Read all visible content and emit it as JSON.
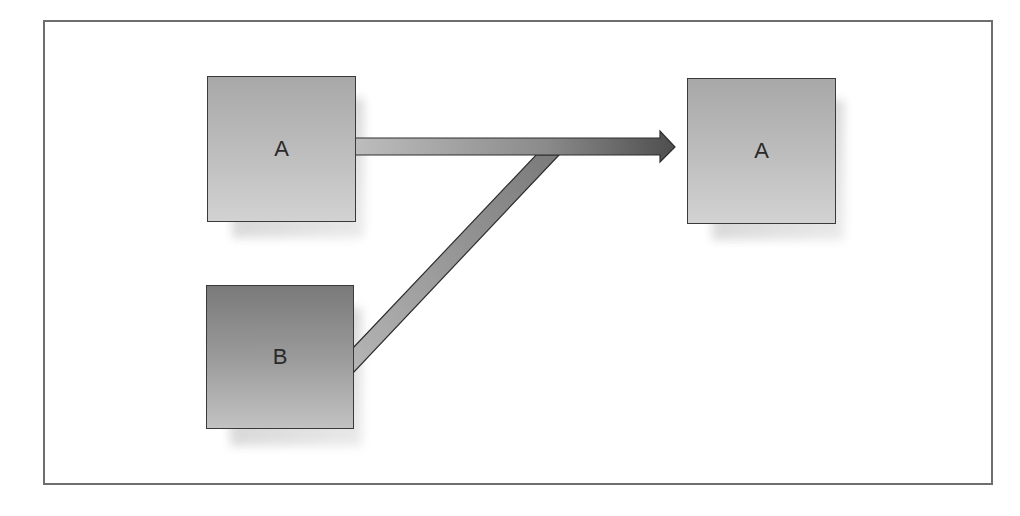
{
  "diagram": {
    "source_boxes": [
      {
        "id": "source-a",
        "label": "A",
        "shade": "light"
      },
      {
        "id": "source-b",
        "label": "B",
        "shade": "dark"
      }
    ],
    "target_box": {
      "id": "target-a",
      "label": "A",
      "shade": "light"
    },
    "connections": [
      {
        "from": "source-a",
        "to": "target-a"
      },
      {
        "from": "source-b",
        "to": "target-a",
        "merges_into": "source-a-arrow"
      }
    ]
  },
  "colors": {
    "frame_border": "#6e6e6e",
    "box_light": "#bcbcbc",
    "box_dark": "#8a8a8a",
    "box_border": "#3a3a3a",
    "arrow_start": "#b8b8b8",
    "arrow_end": "#5a5a5a"
  }
}
